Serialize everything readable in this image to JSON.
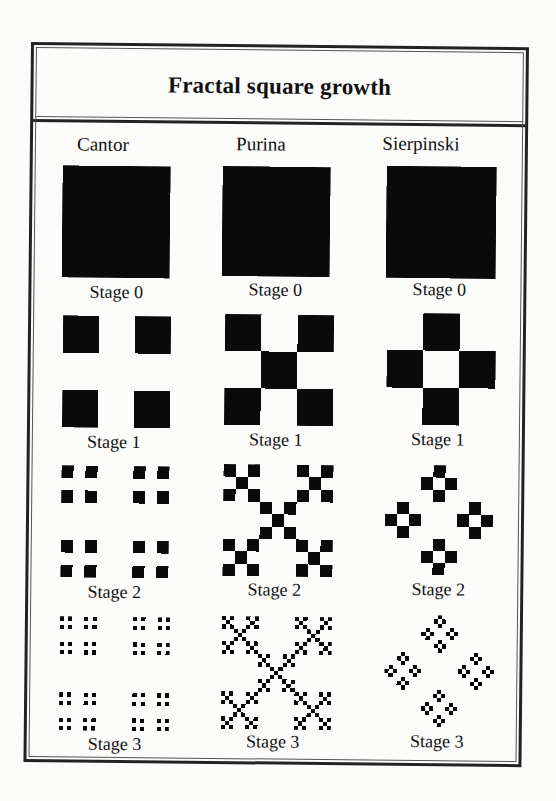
{
  "title": "Fractal square growth",
  "colors": {
    "ink": "#0a0a0a",
    "background": "#fbfbfa",
    "border": "#222222"
  },
  "columns": [
    {
      "name": "Cantor",
      "rule": [
        [
          1,
          0,
          1
        ],
        [
          0,
          0,
          0
        ],
        [
          1,
          0,
          1
        ]
      ]
    },
    {
      "name": "Purina",
      "rule": [
        [
          1,
          0,
          1
        ],
        [
          0,
          1,
          0
        ],
        [
          1,
          0,
          1
        ]
      ]
    },
    {
      "name": "Sierpinski",
      "rule": [
        [
          0,
          1,
          0
        ],
        [
          1,
          0,
          1
        ],
        [
          0,
          1,
          0
        ]
      ]
    }
  ],
  "stages": [
    {
      "label": "Stage 0",
      "level": 0
    },
    {
      "label": "Stage 1",
      "level": 1
    },
    {
      "label": "Stage 2",
      "level": 2
    },
    {
      "label": "Stage 3",
      "level": 3
    }
  ]
}
